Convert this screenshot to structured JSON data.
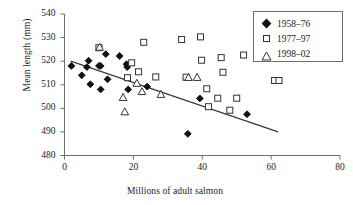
{
  "chart_data": {
    "type": "scatter",
    "title": "",
    "xlabel": "Millions of adult salmon",
    "ylabel": "Mean length (mm)",
    "xlim": [
      0,
      80
    ],
    "ylim": [
      480,
      540
    ],
    "xticks": [
      0,
      20,
      40,
      60,
      80
    ],
    "yticks": [
      480,
      490,
      500,
      510,
      520,
      530,
      540
    ],
    "grid": false,
    "legend_position": "top-right",
    "series": [
      {
        "name": "1958–76",
        "marker": "filled-diamond",
        "color": "#111111",
        "points": [
          [
            2.0,
            518.0
          ],
          [
            5.0,
            514.0
          ],
          [
            6.5,
            517.5
          ],
          [
            7.0,
            520.2
          ],
          [
            7.5,
            510.2
          ],
          [
            10.0,
            518.0
          ],
          [
            10.5,
            518.0
          ],
          [
            10.5,
            508.0
          ],
          [
            12.0,
            523.0
          ],
          [
            12.5,
            512.3
          ],
          [
            16.0,
            522.2
          ],
          [
            18.0,
            518.7
          ],
          [
            18.2,
            517.5
          ],
          [
            18.5,
            508.0
          ],
          [
            24.0,
            509.2
          ],
          [
            35.8,
            489.2
          ],
          [
            39.3,
            504.2
          ],
          [
            53.0,
            497.5
          ]
        ]
      },
      {
        "name": "1977–97",
        "marker": "open-square",
        "color": "#333333",
        "points": [
          [
            10.0,
            525.7
          ],
          [
            18.3,
            513.0
          ],
          [
            19.5,
            519.3
          ],
          [
            21.5,
            515.5
          ],
          [
            23.0,
            528.0
          ],
          [
            26.5,
            513.3
          ],
          [
            34.0,
            529.2
          ],
          [
            35.3,
            513.2
          ],
          [
            39.5,
            530.3
          ],
          [
            39.8,
            520.4
          ],
          [
            41.3,
            508.3
          ],
          [
            41.8,
            500.7
          ],
          [
            44.5,
            504.3
          ],
          [
            45.5,
            521.5
          ],
          [
            46.0,
            515.3
          ],
          [
            48.0,
            499.2
          ],
          [
            50.0,
            504.3
          ],
          [
            52.0,
            522.6
          ],
          [
            61.0,
            511.8
          ],
          [
            62.3,
            511.8
          ]
        ]
      },
      {
        "name": "1998–02",
        "marker": "open-triangle",
        "color": "#333333",
        "points": [
          [
            10.2,
            526.0
          ],
          [
            17.0,
            504.7
          ],
          [
            17.5,
            498.6
          ],
          [
            21.0,
            510.7
          ],
          [
            22.5,
            507.2
          ],
          [
            28.0,
            506.0
          ],
          [
            36.0,
            513.2
          ],
          [
            38.5,
            513.2
          ]
        ]
      }
    ],
    "trendline": {
      "name": "linear-trend",
      "x0": 1.8,
      "y0": 520.0,
      "x1": 62.0,
      "y1": 490.0,
      "color": "#3a3a3a"
    }
  }
}
